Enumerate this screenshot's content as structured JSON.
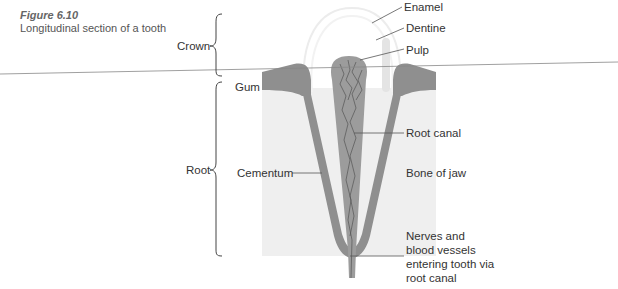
{
  "figure": {
    "number": "Figure 6.10",
    "caption": "Longitudinal section of a tooth"
  },
  "labels": {
    "enamel": "Enamel",
    "dentine": "Dentine",
    "pulp": "Pulp",
    "crown": "Crown",
    "gum": "Gum",
    "root": "Root",
    "cementum": "Cementum",
    "root_canal": "Root canal",
    "bone_of_jaw": "Bone of jaw",
    "nerves": "Nerves and blood vessels entering tooth via root canal"
  },
  "colors": {
    "bone": "#efefef",
    "gum": "#8f8f8f",
    "pulp": "#9c9c9c",
    "line": "#555555",
    "text": "#333333"
  }
}
